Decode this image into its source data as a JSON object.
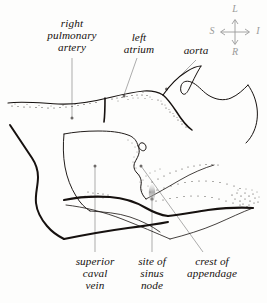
{
  "figure": {
    "type": "anatomical-line-drawing",
    "style": "pen-and-ink with stipple shading",
    "background_color": "#fdfdfc",
    "ink_color": "#16110f",
    "leader_color": "#9d9d9d",
    "stipple_color": "#2a2522"
  },
  "labels": {
    "right_pulmonary_artery": "right\npulmonary\nartery",
    "left_atrium": "left\natrium",
    "aorta": "aorta",
    "superior_caval_vein": "superior\ncaval\nvein",
    "site_of_sinus_node": "site of\nsinus\nnode",
    "crest_of_appendage": "crest of\nappendage"
  },
  "orientation_compass": {
    "name": "orientation-compass",
    "color": "#9a9a9a",
    "up": "L",
    "left": "S",
    "right": "I",
    "down": "R"
  }
}
